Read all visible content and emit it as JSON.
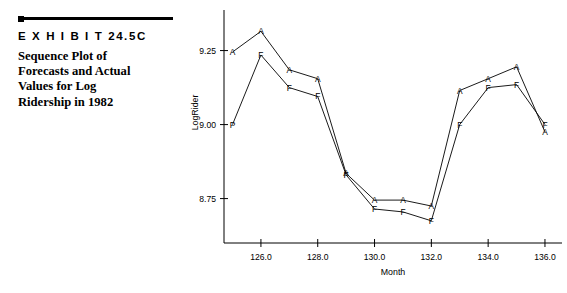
{
  "exhibit": {
    "label": "E X H I B I T  24.5C",
    "caption_lines": [
      "Sequence Plot of",
      "Forecasts and Actual",
      "Values for Log",
      "Ridership in 1982"
    ],
    "caption": "Sequence Plot of Forecasts and Actual Values for Log Ridership in 1982"
  },
  "chart_data": {
    "type": "line",
    "title": "",
    "xlabel": "Month",
    "ylabel": "LogRider",
    "xlim": [
      124.7,
      136.6
    ],
    "ylim": [
      8.6,
      9.36
    ],
    "xticks": [
      126.0,
      128.0,
      130.0,
      132.0,
      134.0,
      136.0
    ],
    "xtick_labels": [
      "126.0",
      "128.0",
      "130.0",
      "132.0",
      "134.0",
      "136.0"
    ],
    "yticks": [
      8.75,
      9.0,
      9.25
    ],
    "ytick_labels": [
      "8.75",
      "9.00",
      "9.25"
    ],
    "grid": false,
    "legend": "none",
    "x": [
      125.0,
      126.0,
      127.0,
      128.0,
      129.0,
      130.0,
      131.0,
      132.0,
      133.0,
      134.0,
      135.0,
      136.0
    ],
    "series": [
      {
        "name": "Actual",
        "marker_label": "A",
        "values": [
          9.245,
          9.315,
          9.185,
          9.155,
          8.835,
          8.745,
          8.745,
          8.725,
          9.115,
          9.155,
          9.195,
          8.975
        ]
      },
      {
        "name": "Forecast",
        "marker_label": "F",
        "first_marker_label": "P",
        "values": [
          9.0,
          9.235,
          9.125,
          9.095,
          8.83,
          8.715,
          8.705,
          8.675,
          9.0,
          9.125,
          9.135,
          9.0
        ]
      }
    ]
  }
}
